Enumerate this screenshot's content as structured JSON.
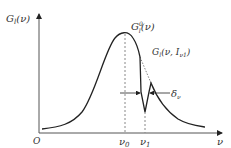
{
  "diagram": {
    "y_axis_label": "G",
    "y_axis_label_sub": "l",
    "y_axis_label_arg": "(ν)",
    "origin_label": "O",
    "x_axis_label": "ν",
    "nu0_label": "ν",
    "nu0_sub": "0",
    "nu1_label": "ν",
    "nu1_sub": "1",
    "peak_label_main": "G",
    "peak_label_sup": "0",
    "peak_label_sub": "l",
    "peak_label_arg": "(ν)",
    "hole_label_main": "G",
    "hole_label_sub": "l",
    "hole_label_arg": "(ν, I",
    "hole_label_arg_sub": "ν1",
    "hole_label_close": ")",
    "width_label": "δ",
    "width_label_sub": "ν",
    "colors": {
      "curve": "#222222",
      "axis": "#444444",
      "dashed": "#888888",
      "text": "#333333"
    }
  }
}
